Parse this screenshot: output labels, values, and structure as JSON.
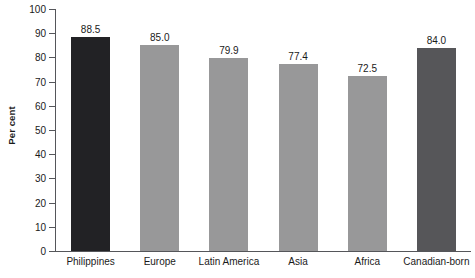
{
  "chart_data": {
    "type": "bar",
    "title": "",
    "xlabel": "",
    "ylabel": "Per cent",
    "categories": [
      "Philippines",
      "Europe",
      "Latin America",
      "Asia",
      "Africa",
      "Canadian-born"
    ],
    "values": [
      88.5,
      85.0,
      79.9,
      77.4,
      72.5,
      84.0
    ],
    "value_labels": [
      "88.5",
      "85.0",
      "79.9",
      "77.4",
      "72.5",
      "84.0"
    ],
    "ylim": [
      0,
      100
    ],
    "ytick_labels": [
      "100",
      "90",
      "80",
      "70",
      "60",
      "50",
      "40",
      "30",
      "20",
      "10",
      "0"
    ],
    "ytick_values": [
      100,
      90,
      80,
      70,
      60,
      50,
      40,
      30,
      20,
      10,
      0
    ],
    "grid": false,
    "legend": null,
    "bar_colors": [
      "#222225",
      "#989899",
      "#989899",
      "#989899",
      "#989899",
      "#565659"
    ],
    "axis_color": "#55565a",
    "text_color": "#1a1a1a",
    "background": "#ffffff"
  }
}
